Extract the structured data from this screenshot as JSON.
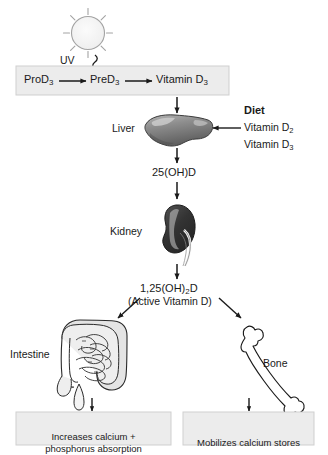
{
  "skin_box": {
    "steps": [
      {
        "name": "pro-vitamin-d3",
        "text": "ProD",
        "sub": "3"
      },
      {
        "name": "pre-vitamin-d3",
        "text": "PreD",
        "sub": "3"
      },
      {
        "name": "vitamin-d3",
        "text": "Vitamin D",
        "sub": "3"
      }
    ],
    "fill": "#ececec",
    "border": "#cfcfcf"
  },
  "sun": {
    "label": "UV",
    "icon": "sun-icon",
    "ray_count": 8,
    "fill": "#f2f2f2",
    "stroke": "#9a9a9a"
  },
  "uv_wave": {
    "icon": "uv-wavy-arrow-icon",
    "color": "#1a1a1a"
  },
  "diet": {
    "heading": "Diet",
    "items": [
      {
        "text": "Vitamin D",
        "sub": "2"
      },
      {
        "text": "Vitamin D",
        "sub": "3"
      }
    ]
  },
  "organs": [
    {
      "name": "liver",
      "label": "Liver",
      "icon": "liver-icon",
      "fill": "#8a8a8a",
      "stroke": "#3a3a3a"
    },
    {
      "name": "kidney",
      "label": "Kidney",
      "icon": "kidney-icon",
      "fill": "#3c3c3c",
      "stroke": "#1a1a1a"
    },
    {
      "name": "intestine",
      "label": "Intestine",
      "icon": "intestine-icon",
      "fill": "#d8d8d8",
      "stroke": "#2a2a2a"
    },
    {
      "name": "bone",
      "label": "Bone",
      "icon": "bone-icon",
      "fill": "#ffffff",
      "stroke": "#1a1a1a"
    }
  ],
  "metabolites": {
    "liver_product": {
      "text": "25(OH)D"
    },
    "kidney_product": {
      "text": "1,25(OH)",
      "sub": "2",
      "suffix": "D"
    },
    "kidney_product_note": "(Active Vitamin D)"
  },
  "outcomes": [
    {
      "name": "intestine-outcome",
      "text": "Increases calcium +\nphosphorus absorption"
    },
    {
      "name": "bone-outcome",
      "text": "Mobilizes calcium stores"
    }
  ],
  "colors": {
    "arrow": "#1a1a1a",
    "box_fill": "#ececec",
    "box_border": "#cfcfcf",
    "text": "#1a1a1a",
    "background": "#ffffff"
  }
}
